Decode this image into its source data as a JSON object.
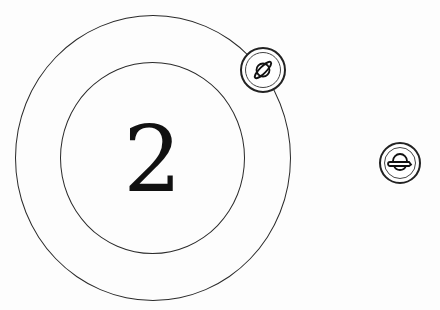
{
  "game": {
    "center_value": "2",
    "rings": [
      {
        "name": "outer-ring"
      },
      {
        "name": "inner-ring"
      }
    ],
    "buttons": [
      {
        "name": "orbit-planet-button",
        "icon": "planet-tilted-icon",
        "position": "on-outer-ring-top-right"
      },
      {
        "name": "planet-button",
        "icon": "planet-horizontal-icon",
        "position": "right"
      }
    ]
  },
  "colors": {
    "background": "#fdfdfd",
    "stroke": "#2a2a2a",
    "text": "#111111"
  }
}
